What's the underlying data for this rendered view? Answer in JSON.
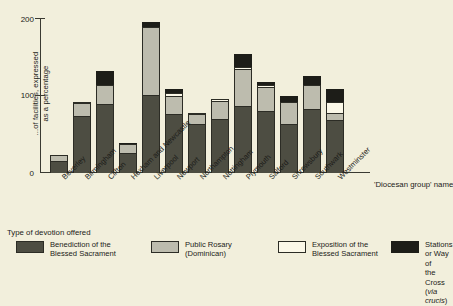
{
  "chart_data": {
    "type": "bar",
    "subtype": "stacked-bar",
    "title": "",
    "ylabel": "...of facilities, expressed\nas a percentage",
    "xlabel": "'Diocesan group' name",
    "ylim": [
      0,
      200
    ],
    "yticks": [
      0,
      100,
      200
    ],
    "ytick_labels": [
      "0",
      "100",
      "200"
    ],
    "grid": false,
    "legend_position": "below-plot",
    "legend_title": "Type of devotion offered",
    "categories": [
      "Beverley",
      "Birmingham",
      "Clifton",
      "Hexham and Newcastle",
      "Liverpool",
      "Newport",
      "Northampton",
      "Nottingham",
      "Plymouth",
      "Salford",
      "Shrewsbury",
      "Southwark",
      "Westminster"
    ],
    "series": [
      {
        "name": "Benediction of the Blessed Sacrament",
        "color": "#4d4d42",
        "values": [
          16,
          74,
          89,
          26,
          101,
          76,
          63,
          70,
          86,
          80,
          63,
          83,
          68
        ]
      },
      {
        "name": "Public Rosary (Dominican)",
        "color": "#bdbcae",
        "values": [
          7,
          16,
          25,
          11,
          88,
          24,
          13,
          23,
          48,
          31,
          29,
          30,
          10
        ]
      },
      {
        "name": "Exposition of the Blessed Sacrament",
        "color": "#fbf8e8",
        "values": [
          0,
          2,
          0,
          0,
          0,
          3,
          2,
          3,
          3,
          2,
          0,
          0,
          14
        ]
      },
      {
        "name": "Stations or Way of the Cross (via crucis)",
        "color": "#1d1d18",
        "values": [
          0,
          0,
          18,
          2,
          6,
          6,
          0,
          0,
          16,
          4,
          8,
          12,
          17
        ]
      }
    ],
    "totals": [
      23,
      92,
      132,
      39,
      195,
      109,
      78,
      96,
      153,
      117,
      100,
      125,
      109
    ]
  },
  "axis": {
    "y_title": "...of facilities, expressed\nas a percentage",
    "x_title": "'Diocesan group' name",
    "ticks": [
      "200",
      "100",
      "0"
    ]
  },
  "legend": {
    "title": "Type of devotion offered",
    "items": [
      {
        "label": "Benediction of the\nBlessed Sacrament",
        "swatch": "ben"
      },
      {
        "label": "Public Rosary\n(Dominican)",
        "swatch": "ros"
      },
      {
        "label": "Exposition of the\nBlessed Sacrament",
        "swatch": "exp"
      },
      {
        "label": "Stations or Way of\nthe Cross (via crucis)",
        "swatch": "sta"
      }
    ]
  }
}
